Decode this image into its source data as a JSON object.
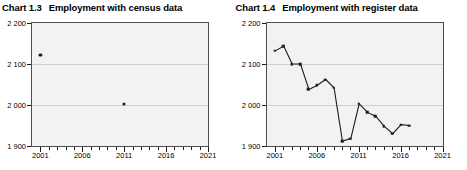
{
  "charts": [
    {
      "id": "chart-1-3",
      "number": "Chart 1.3",
      "title": "Employment with census data",
      "axis": {
        "y_ticks": [
          "2 200",
          "2 100",
          "2 000",
          "1 900"
        ],
        "y_values": [
          2200,
          2100,
          2000,
          1900
        ],
        "x_ticks": [
          "2001",
          "2006",
          "2011",
          "2016",
          "2021"
        ],
        "x_values": [
          2001,
          2006,
          2011,
          2016,
          2021
        ]
      }
    },
    {
      "id": "chart-1-4",
      "number": "Chart 1.4",
      "title": "Employment with register data",
      "axis": {
        "y_ticks": [
          "2 200",
          "2 100",
          "2 000",
          "1 900"
        ],
        "y_values": [
          2200,
          2100,
          2000,
          1900
        ],
        "x_ticks": [
          "2001",
          "2006",
          "2011",
          "2016",
          "2021"
        ],
        "x_values": [
          2001,
          2006,
          2011,
          2016,
          2021
        ]
      }
    }
  ],
  "chart_data": [
    {
      "type": "scatter",
      "title": "Employment with census data",
      "subtitle": "Chart 1.3",
      "xlabel": "",
      "ylabel": "",
      "xlim": [
        2000,
        2021
      ],
      "ylim": [
        1900,
        2200
      ],
      "grid": true,
      "legend": "none",
      "x": [
        2001,
        2011
      ],
      "y": [
        2122,
        2002
      ],
      "series": [
        {
          "name": "Employment with census data",
          "marker": "circle",
          "color": "#1a1a1a",
          "points": [
            {
              "x": 2001,
              "y": 2122
            },
            {
              "x": 2011,
              "y": 2002
            }
          ]
        }
      ]
    },
    {
      "type": "line",
      "title": "Employment with register data",
      "subtitle": "Chart 1.4",
      "xlabel": "",
      "ylabel": "",
      "xlim": [
        2000,
        2021
      ],
      "ylim": [
        1900,
        2200
      ],
      "grid": true,
      "legend": "none",
      "x": [
        2001,
        2002,
        2003,
        2004,
        2005,
        2006,
        2007,
        2008,
        2009,
        2010,
        2011,
        2012,
        2013,
        2014,
        2015,
        2016,
        2017
      ],
      "y": [
        2132,
        2144,
        2100,
        2100,
        2038,
        2048,
        2062,
        2042,
        1912,
        1918,
        2003,
        1982,
        1972,
        1948,
        1930,
        1952,
        1950
      ],
      "series": [
        {
          "name": "Employment with register data",
          "marker": "square",
          "color": "#1a1a1a",
          "points": [
            {
              "x": 2001,
              "y": 2132
            },
            {
              "x": 2002,
              "y": 2144
            },
            {
              "x": 2003,
              "y": 2100
            },
            {
              "x": 2004,
              "y": 2100
            },
            {
              "x": 2005,
              "y": 2038
            },
            {
              "x": 2006,
              "y": 2048
            },
            {
              "x": 2007,
              "y": 2062
            },
            {
              "x": 2008,
              "y": 2042
            },
            {
              "x": 2009,
              "y": 1912
            },
            {
              "x": 2010,
              "y": 1918
            },
            {
              "x": 2011,
              "y": 2003
            },
            {
              "x": 2012,
              "y": 1982
            },
            {
              "x": 2013,
              "y": 1972
            },
            {
              "x": 2014,
              "y": 1948
            },
            {
              "x": 2015,
              "y": 1930
            },
            {
              "x": 2016,
              "y": 1952
            },
            {
              "x": 2017,
              "y": 1950
            }
          ]
        }
      ]
    }
  ],
  "style": {
    "plot_background": "#f2f2f2",
    "plot_border": "#4d4d4d",
    "gridline_color": "#cfcfcf",
    "series_color": "#1a1a1a",
    "text_color": "#000000"
  }
}
